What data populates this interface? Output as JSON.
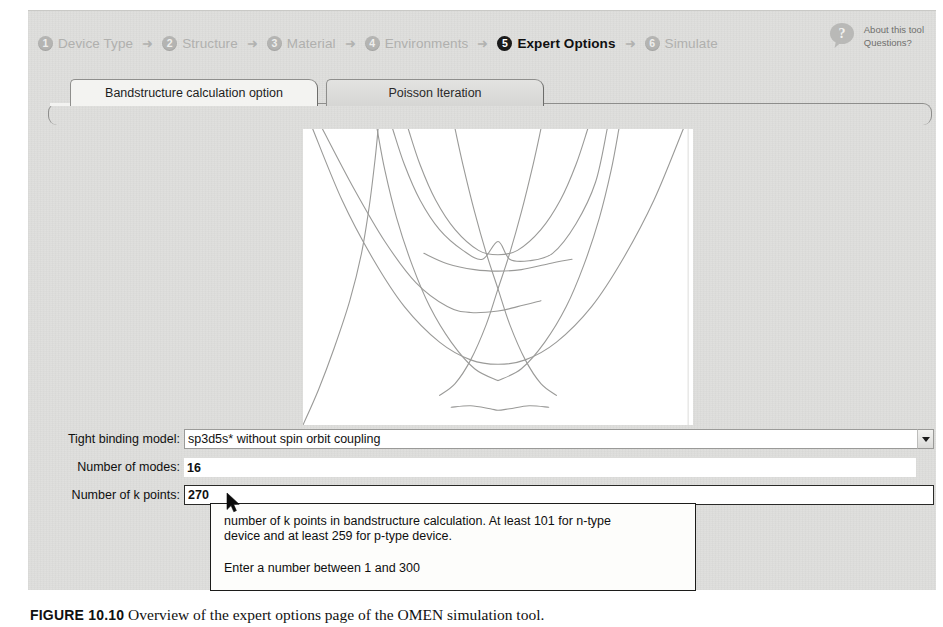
{
  "app": {
    "title": "Expert Options — Bandstructure calculation option"
  },
  "wizard": {
    "steps": [
      {
        "number": "1",
        "label": "Device Type",
        "active": false
      },
      {
        "number": "2",
        "label": "Structure",
        "active": false
      },
      {
        "number": "3",
        "label": "Material",
        "active": false
      },
      {
        "number": "4",
        "label": "Environments",
        "active": false
      },
      {
        "number": "5",
        "label": "Expert Options",
        "active": true
      },
      {
        "number": "6",
        "label": "Simulate",
        "active": false
      }
    ],
    "separator": "➜"
  },
  "help": {
    "icon": "question-bubble-icon",
    "line1": "About this tool",
    "line2": "Questions?"
  },
  "tabs": [
    {
      "label": "Bandstructure calculation option",
      "active": true
    },
    {
      "label": "Poisson Iteration",
      "active": false
    }
  ],
  "form": {
    "tight_binding": {
      "label": "Tight binding model:",
      "value": "sp3d5s* without spin orbit coupling",
      "dropdown_icon": "chevron-down-icon"
    },
    "modes": {
      "label": "Number of modes:",
      "value": "16"
    },
    "kpoints": {
      "label": "Number of k points:",
      "value": "270"
    }
  },
  "tooltip": {
    "line1": "number of k points in bandstructure calculation. At least 101 for n-type",
    "line2": "device and at least 259 for p-type device.",
    "line3": "Enter a number between 1 and 300"
  },
  "caption": {
    "fig_label": "FIGURE 10.10",
    "text": "Overview of the expert options page of the OMEN simulation tool."
  },
  "chart_data": {
    "type": "line",
    "title": "",
    "xlabel": "",
    "ylabel": "",
    "subtitle": "Silicon nanowire bandstructure E(k) dispersion — valence bands (upper, inverted) and conduction bands (lower parabolas)",
    "grid": false,
    "legend": null,
    "xlim": [
      -1,
      1
    ],
    "ylim": [
      0,
      1
    ],
    "line_color": "#9a9a98",
    "line_width": 1.1,
    "background": "#ffffff",
    "vertical_marker_x": 0.975,
    "series": [
      {
        "name": "v-band-1-left",
        "points": [
          [
            -1.0,
            0.0
          ],
          [
            -0.92,
            0.12
          ],
          [
            -0.84,
            0.26
          ],
          [
            -0.76,
            0.42
          ],
          [
            -0.7,
            0.58
          ],
          [
            -0.66,
            0.74
          ],
          [
            -0.63,
            0.9
          ],
          [
            -0.615,
            1.0
          ]
        ]
      },
      {
        "name": "v-band-2-left",
        "points": [
          [
            -0.62,
            1.0
          ],
          [
            -0.58,
            0.86
          ],
          [
            -0.52,
            0.7
          ],
          [
            -0.44,
            0.54
          ],
          [
            -0.35,
            0.4
          ],
          [
            -0.24,
            0.28
          ],
          [
            -0.12,
            0.19
          ],
          [
            0.0,
            0.15
          ]
        ]
      },
      {
        "name": "v-band-2-right",
        "points": [
          [
            0.0,
            0.15
          ],
          [
            0.12,
            0.19
          ],
          [
            0.24,
            0.28
          ],
          [
            0.35,
            0.4
          ],
          [
            0.44,
            0.54
          ],
          [
            0.52,
            0.7
          ],
          [
            0.58,
            0.86
          ],
          [
            0.62,
            1.0
          ]
        ]
      },
      {
        "name": "v-band-3-left",
        "points": [
          [
            -0.54,
            1.0
          ],
          [
            -0.48,
            0.88
          ],
          [
            -0.4,
            0.76
          ],
          [
            -0.3,
            0.66
          ],
          [
            -0.18,
            0.59
          ],
          [
            -0.08,
            0.56
          ],
          [
            0.0,
            0.62
          ],
          [
            0.06,
            0.56
          ],
          [
            0.16,
            0.555
          ],
          [
            0.28,
            0.58
          ],
          [
            0.4,
            0.68
          ],
          [
            0.5,
            0.82
          ],
          [
            0.56,
            1.0
          ]
        ]
      },
      {
        "name": "v-band-4",
        "points": [
          [
            -0.46,
            1.0
          ],
          [
            -0.4,
            0.88
          ],
          [
            -0.32,
            0.76
          ],
          [
            -0.22,
            0.66
          ],
          [
            -0.1,
            0.59
          ],
          [
            0.0,
            0.575
          ],
          [
            0.1,
            0.59
          ],
          [
            0.22,
            0.66
          ],
          [
            0.32,
            0.76
          ],
          [
            0.4,
            0.88
          ],
          [
            0.46,
            1.0
          ]
        ]
      },
      {
        "name": "v-band-5",
        "points": [
          [
            -0.38,
            0.58
          ],
          [
            -0.26,
            0.545
          ],
          [
            -0.12,
            0.525
          ],
          [
            0.0,
            0.52
          ],
          [
            0.12,
            0.525
          ],
          [
            0.26,
            0.545
          ],
          [
            0.38,
            0.56
          ]
        ]
      },
      {
        "name": "c-band-1",
        "points": [
          [
            -0.95,
            1.0
          ],
          [
            -0.8,
            0.76
          ],
          [
            -0.64,
            0.56
          ],
          [
            -0.48,
            0.4
          ],
          [
            -0.3,
            0.28
          ],
          [
            -0.14,
            0.22
          ],
          [
            0.0,
            0.205
          ],
          [
            0.14,
            0.22
          ],
          [
            0.3,
            0.28
          ],
          [
            0.48,
            0.4
          ],
          [
            0.64,
            0.56
          ],
          [
            0.8,
            0.76
          ],
          [
            0.95,
            1.0
          ]
        ]
      },
      {
        "name": "c-band-2-left",
        "points": [
          [
            -0.9,
            1.0
          ],
          [
            -0.74,
            0.8
          ],
          [
            -0.58,
            0.62
          ],
          [
            -0.42,
            0.48
          ],
          [
            -0.26,
            0.4
          ],
          [
            -0.14,
            0.38
          ],
          [
            0.0,
            0.385
          ],
          [
            0.1,
            0.4
          ],
          [
            0.22,
            0.42
          ]
        ]
      },
      {
        "name": "c-band-3",
        "points": [
          [
            -0.3,
            0.1
          ],
          [
            -0.22,
            0.14
          ],
          [
            -0.14,
            0.22
          ],
          [
            -0.06,
            0.34
          ],
          [
            0.0,
            0.46
          ],
          [
            0.06,
            0.58
          ],
          [
            0.12,
            0.72
          ],
          [
            0.18,
            0.88
          ],
          [
            0.22,
            1.0
          ]
        ]
      },
      {
        "name": "c-band-4",
        "points": [
          [
            0.3,
            0.1
          ],
          [
            0.22,
            0.14
          ],
          [
            0.14,
            0.22
          ],
          [
            0.06,
            0.34
          ],
          [
            0.0,
            0.46
          ],
          [
            -0.06,
            0.58
          ],
          [
            -0.12,
            0.72
          ],
          [
            -0.18,
            0.88
          ],
          [
            -0.22,
            1.0
          ]
        ]
      },
      {
        "name": "c-band-5",
        "points": [
          [
            -0.24,
            0.06
          ],
          [
            -0.14,
            0.065
          ],
          [
            -0.04,
            0.055
          ],
          [
            0.0,
            0.05
          ],
          [
            0.06,
            0.055
          ],
          [
            0.16,
            0.065
          ],
          [
            0.26,
            0.06
          ]
        ]
      }
    ]
  }
}
